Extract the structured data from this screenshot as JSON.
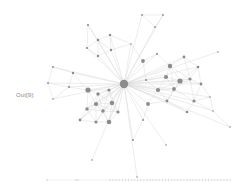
{
  "cell": {
    "output_prompt": "Out[9]:"
  },
  "graph": {
    "type": "network",
    "node_color": "#8c8c8c",
    "edge_color": "#d6d6d6",
    "hub": {
      "x": 124,
      "y": 84,
      "r": 4.2
    },
    "nodes": [
      {
        "x": 142,
        "y": 15,
        "r": 0.9
      },
      {
        "x": 163,
        "y": 15,
        "r": 0.9
      },
      {
        "x": 155,
        "y": 27,
        "r": 0.9
      },
      {
        "x": 88,
        "y": 25,
        "r": 1.1
      },
      {
        "x": 110,
        "y": 35,
        "r": 1.2
      },
      {
        "x": 98,
        "y": 40,
        "r": 1.3
      },
      {
        "x": 87,
        "y": 48,
        "r": 1.1
      },
      {
        "x": 111,
        "y": 50,
        "r": 1.2
      },
      {
        "x": 98,
        "y": 56,
        "r": 1.2
      },
      {
        "x": 131,
        "y": 44,
        "r": 0.8
      },
      {
        "x": 143,
        "y": 61,
        "r": 1.9
      },
      {
        "x": 157,
        "y": 54,
        "r": 1.1
      },
      {
        "x": 184,
        "y": 57,
        "r": 1.4
      },
      {
        "x": 218,
        "y": 52,
        "r": 0.8
      },
      {
        "x": 170,
        "y": 66,
        "r": 2.2
      },
      {
        "x": 198,
        "y": 67,
        "r": 1.3
      },
      {
        "x": 166,
        "y": 77,
        "r": 2.1
      },
      {
        "x": 180,
        "y": 81,
        "r": 2.6
      },
      {
        "x": 190,
        "y": 79,
        "r": 1.6
      },
      {
        "x": 201,
        "y": 84,
        "r": 1.4
      },
      {
        "x": 146,
        "y": 80,
        "r": 1.0
      },
      {
        "x": 158,
        "y": 90,
        "r": 2.1
      },
      {
        "x": 174,
        "y": 89,
        "r": 1.9
      },
      {
        "x": 210,
        "y": 97,
        "r": 0.8
      },
      {
        "x": 167,
        "y": 101,
        "r": 1.4
      },
      {
        "x": 194,
        "y": 101,
        "r": 1.6
      },
      {
        "x": 148,
        "y": 104,
        "r": 1.9
      },
      {
        "x": 213,
        "y": 111,
        "r": 0.8
      },
      {
        "x": 187,
        "y": 112,
        "r": 1.3
      },
      {
        "x": 230,
        "y": 127,
        "r": 0.8
      },
      {
        "x": 53,
        "y": 67,
        "r": 0.9
      },
      {
        "x": 73,
        "y": 73,
        "r": 1.2
      },
      {
        "x": 48,
        "y": 83,
        "r": 0.9
      },
      {
        "x": 69,
        "y": 87,
        "r": 1.1
      },
      {
        "x": 53,
        "y": 99,
        "r": 0.8
      },
      {
        "x": 88,
        "y": 90,
        "r": 2.6
      },
      {
        "x": 98,
        "y": 94,
        "r": 1.7
      },
      {
        "x": 109,
        "y": 90,
        "r": 1.6
      },
      {
        "x": 96,
        "y": 104,
        "r": 2.1
      },
      {
        "x": 112,
        "y": 103,
        "r": 2.2
      },
      {
        "x": 87,
        "y": 109,
        "r": 1.7
      },
      {
        "x": 103,
        "y": 111,
        "r": 1.7
      },
      {
        "x": 118,
        "y": 112,
        "r": 1.6
      },
      {
        "x": 80,
        "y": 120,
        "r": 1.4
      },
      {
        "x": 96,
        "y": 122,
        "r": 1.6
      },
      {
        "x": 109,
        "y": 122,
        "r": 2.3
      },
      {
        "x": 143,
        "y": 120,
        "r": 1.0
      },
      {
        "x": 133,
        "y": 140,
        "r": 1.0
      },
      {
        "x": 166,
        "y": 145,
        "r": 0.8
      },
      {
        "x": 92,
        "y": 160,
        "r": 0.8
      },
      {
        "x": 137,
        "y": 177,
        "r": 0.8
      }
    ],
    "baseline": {
      "x1": 46,
      "x2": 230,
      "y": 180
    },
    "isolated_node_count": 40
  }
}
